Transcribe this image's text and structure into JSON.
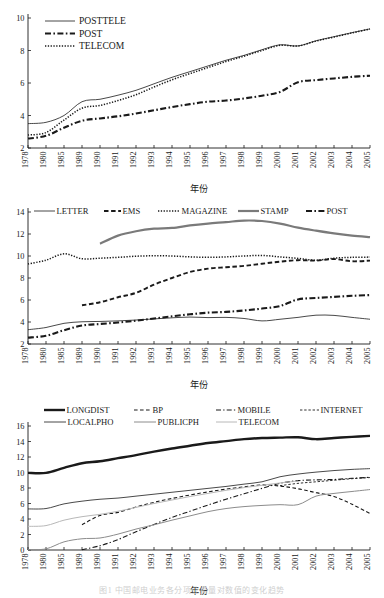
{
  "figure": {
    "caption": "图1  中国邮电业务各分项业务量对数值的变化趋势",
    "axis_label_x": "年份",
    "years": [
      "1978",
      "1980",
      "1985",
      "1989",
      "1990",
      "1991",
      "1992",
      "1993",
      "1994",
      "1995",
      "1996",
      "1997",
      "1998",
      "1999",
      "2000",
      "2001",
      "2002",
      "2003",
      "2004",
      "2005"
    ]
  },
  "chart_data": [
    {
      "id": "chart-posttele",
      "type": "line",
      "title": "",
      "xlabel": "年份",
      "ylabel": "",
      "grid": false,
      "legend_position": "top-left",
      "xlim": [
        0,
        19
      ],
      "ylim": [
        2,
        10
      ],
      "yticks": [
        2,
        4,
        6,
        8,
        10
      ],
      "categories": [
        "1978",
        "1980",
        "1985",
        "1989",
        "1990",
        "1991",
        "1992",
        "1993",
        "1994",
        "1995",
        "1996",
        "1997",
        "1998",
        "1999",
        "2000",
        "2001",
        "2002",
        "2003",
        "2004",
        "2005"
      ],
      "series": [
        {
          "name": "POSTTELE",
          "style": "solid-thin",
          "color": "#1a1a1a",
          "values": [
            3.5,
            3.58,
            4.0,
            4.85,
            5.0,
            5.25,
            5.55,
            5.95,
            6.35,
            6.7,
            7.05,
            7.4,
            7.7,
            8.05,
            8.35,
            8.28,
            8.6,
            8.85,
            9.1,
            9.33
          ]
        },
        {
          "name": "POST",
          "style": "dashdot-thick",
          "color": "#1a1a1a",
          "values": [
            2.58,
            2.75,
            3.25,
            3.68,
            3.82,
            3.95,
            4.12,
            4.32,
            4.52,
            4.7,
            4.85,
            4.92,
            5.05,
            5.22,
            5.45,
            6.05,
            6.18,
            6.28,
            6.38,
            6.45
          ]
        },
        {
          "name": "TELECOM",
          "style": "dotted",
          "color": "#1a1a1a",
          "values": [
            2.8,
            2.95,
            3.72,
            4.45,
            4.62,
            4.92,
            5.28,
            5.75,
            6.2,
            6.58,
            6.95,
            7.32,
            7.65,
            8.0,
            8.32,
            8.28,
            8.58,
            8.83,
            9.08,
            9.32
          ]
        }
      ]
    },
    {
      "id": "chart-post-detail",
      "type": "line",
      "title": "",
      "xlabel": "年份",
      "ylabel": "",
      "grid": false,
      "legend_position": "top",
      "xlim": [
        0,
        19
      ],
      "ylim": [
        2,
        14
      ],
      "yticks": [
        2,
        4,
        6,
        8,
        10,
        12,
        14
      ],
      "categories": [
        "1978",
        "1980",
        "1985",
        "1989",
        "1990",
        "1991",
        "1992",
        "1993",
        "1994",
        "1995",
        "1996",
        "1997",
        "1998",
        "1999",
        "2000",
        "2001",
        "2002",
        "2003",
        "2004",
        "2005"
      ],
      "series": [
        {
          "name": "LETTER",
          "style": "solid-thin",
          "color": "#1a1a1a",
          "values": [
            3.3,
            3.5,
            3.88,
            4.02,
            4.05,
            4.1,
            4.18,
            4.28,
            4.38,
            4.45,
            4.4,
            4.42,
            4.32,
            4.1,
            4.25,
            4.42,
            4.62,
            4.6,
            4.42,
            4.25
          ]
        },
        {
          "name": "EMS",
          "style": "dashed-thick",
          "color": "#1a1a1a",
          "values": [
            null,
            null,
            null,
            5.52,
            5.8,
            6.25,
            6.65,
            7.4,
            8.0,
            8.55,
            8.85,
            8.98,
            9.1,
            9.3,
            9.48,
            9.62,
            9.58,
            9.72,
            9.52,
            9.58
          ]
        },
        {
          "name": "MAGAZINE",
          "style": "dotted",
          "color": "#1a1a1a",
          "values": [
            9.28,
            9.62,
            10.2,
            9.75,
            9.8,
            9.88,
            9.98,
            10.02,
            10.0,
            9.92,
            9.88,
            9.92,
            10.0,
            10.05,
            9.92,
            9.78,
            9.62,
            9.8,
            9.88,
            9.9
          ]
        },
        {
          "name": "STAMP",
          "style": "solid-gray-thick",
          "color": "#7a7a7a",
          "values": [
            null,
            null,
            null,
            null,
            11.12,
            11.85,
            12.25,
            12.48,
            12.55,
            12.78,
            12.95,
            13.08,
            13.22,
            13.18,
            12.95,
            12.58,
            12.3,
            12.05,
            11.85,
            11.72
          ]
        },
        {
          "name": "POST",
          "style": "dashdot-thick",
          "color": "#1a1a1a",
          "values": [
            2.58,
            2.75,
            3.25,
            3.68,
            3.82,
            3.95,
            4.12,
            4.32,
            4.52,
            4.7,
            4.85,
            4.92,
            5.05,
            5.22,
            5.45,
            6.05,
            6.18,
            6.28,
            6.38,
            6.45
          ]
        }
      ]
    },
    {
      "id": "chart-telecom-detail",
      "type": "line",
      "title": "",
      "xlabel": "年份",
      "ylabel": "",
      "grid": false,
      "legend_position": "top",
      "xlim": [
        0,
        19
      ],
      "ylim": [
        0,
        16
      ],
      "yticks": [
        0,
        2,
        4,
        6,
        8,
        10,
        12,
        14,
        16
      ],
      "categories": [
        "1978",
        "1980",
        "1985",
        "1989",
        "1990",
        "1991",
        "1992",
        "1993",
        "1994",
        "1995",
        "1996",
        "1997",
        "1998",
        "1999",
        "2000",
        "2001",
        "2002",
        "2003",
        "2004",
        "2005"
      ],
      "series": [
        {
          "name": "LONGDIST",
          "style": "solid-extra-thick",
          "color": "#1a1a1a",
          "values": [
            9.95,
            9.95,
            10.6,
            11.2,
            11.45,
            11.85,
            12.25,
            12.7,
            13.1,
            13.45,
            13.8,
            14.05,
            14.3,
            14.45,
            14.5,
            14.55,
            14.3,
            14.45,
            14.6,
            14.72
          ]
        },
        {
          "name": "BP",
          "style": "dashed-thin",
          "color": "#1a1a1a",
          "values": [
            null,
            null,
            null,
            3.25,
            4.45,
            4.85,
            5.55,
            6.15,
            6.65,
            7.1,
            7.5,
            7.85,
            8.15,
            8.4,
            8.25,
            7.9,
            7.4,
            6.9,
            5.9,
            4.7
          ]
        },
        {
          "name": "MOBILE",
          "style": "dashdot-thin",
          "color": "#1a1a1a",
          "values": [
            null,
            null,
            null,
            0.05,
            0.55,
            1.35,
            2.35,
            3.3,
            4.2,
            5.0,
            5.8,
            6.55,
            7.25,
            7.95,
            8.6,
            8.95,
            9.05,
            9.1,
            9.25,
            9.38
          ]
        },
        {
          "name": "INTERNET",
          "style": "finedashed",
          "color": "#1a1a1a",
          "values": [
            null,
            null,
            null,
            null,
            null,
            null,
            null,
            null,
            null,
            null,
            null,
            null,
            null,
            null,
            8.3,
            8.6,
            8.8,
            9.0,
            9.2,
            9.35
          ]
        },
        {
          "name": "LOCALPHO",
          "style": "solid-thin",
          "color": "#1a1a1a",
          "values": [
            5.3,
            5.35,
            5.95,
            6.3,
            6.55,
            6.7,
            6.95,
            7.2,
            7.45,
            7.7,
            7.95,
            8.2,
            8.5,
            8.8,
            9.45,
            9.8,
            10.05,
            10.25,
            10.4,
            10.5
          ]
        },
        {
          "name": "PUBLICPH",
          "style": "solid-gray",
          "color": "#8c8c8c",
          "values": [
            0.05,
            0.15,
            1.05,
            1.45,
            1.55,
            2.05,
            2.7,
            3.25,
            3.85,
            4.4,
            4.95,
            5.35,
            5.6,
            5.75,
            5.85,
            5.85,
            6.95,
            7.3,
            7.55,
            7.8
          ]
        },
        {
          "name": "TELECOM",
          "style": "solid-lightgray",
          "color": "#b8b8b8",
          "values": [
            3.05,
            3.15,
            3.85,
            4.3,
            4.6,
            5.0,
            5.5,
            6.0,
            6.45,
            6.9,
            7.3,
            7.7,
            8.05,
            8.35,
            8.65,
            8.9,
            null,
            null,
            null,
            null
          ]
        }
      ]
    }
  ],
  "panels": {
    "top": {
      "legend": [
        {
          "label": "POSTTELE",
          "style": "solid-thin"
        },
        {
          "label": "POST",
          "style": "dashdot-thick"
        },
        {
          "label": "TELECOM",
          "style": "dotted"
        }
      ],
      "yticks": [
        "2",
        "4",
        "6",
        "8",
        "10"
      ],
      "xlabel": "年份"
    },
    "mid": {
      "legend": [
        {
          "label": "LETTER",
          "style": "solid-thin"
        },
        {
          "label": "EMS",
          "style": "dashed-thick"
        },
        {
          "label": "MAGAZINE",
          "style": "dotted"
        },
        {
          "label": "STAMP",
          "style": "solid-gray-thick"
        },
        {
          "label": "POST",
          "style": "dashdot-thick"
        }
      ],
      "yticks": [
        "2",
        "4",
        "6",
        "8",
        "10",
        "12",
        "14"
      ],
      "xlabel": "年份"
    },
    "bot": {
      "legend_row1": [
        {
          "label": "LONGDIST",
          "style": "solid-extra-thick"
        },
        {
          "label": "BP",
          "style": "dashed-thin"
        },
        {
          "label": "MOBILE",
          "style": "dashdot-thin"
        },
        {
          "label": "INTERNET",
          "style": "finedashed"
        }
      ],
      "legend_row2": [
        {
          "label": "LOCALPHO",
          "style": "solid-thin"
        },
        {
          "label": "PUBLICPH",
          "style": "solid-gray"
        },
        {
          "label": "TELECOM",
          "style": "solid-lightgray"
        }
      ],
      "yticks": [
        "0",
        "2",
        "4",
        "6",
        "8",
        "10",
        "12",
        "14",
        "16"
      ],
      "xlabel": "年份"
    }
  }
}
